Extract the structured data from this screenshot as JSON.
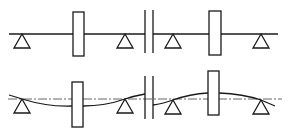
{
  "diagram": {
    "title": "",
    "colors": {
      "stroke": "#1a1a1a",
      "centerline": "#555555",
      "background": "#ffffff"
    },
    "rows": [
      {
        "id": "aligned",
        "shaft_y": 34,
        "bearings": [
          22,
          125,
          173,
          261
        ],
        "disks": [
          {
            "x": 73,
            "w": 11,
            "y": 12,
            "h": 44
          },
          {
            "x": 209,
            "w": 12,
            "y": 11,
            "h": 44
          }
        ],
        "coupling_x": [
          145,
          153
        ]
      },
      {
        "id": "deflected",
        "centerline_y": 99,
        "bearings": [
          22,
          125,
          173,
          261
        ],
        "disks": [
          {
            "x": 72,
            "w": 11,
            "y": 82,
            "h": 45
          },
          {
            "x": 208,
            "w": 11,
            "y": 71,
            "h": 44
          }
        ],
        "coupling_x": [
          145,
          153
        ]
      }
    ]
  }
}
